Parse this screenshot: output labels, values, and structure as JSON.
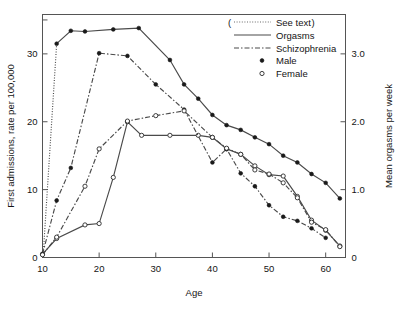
{
  "chart_data": {
    "type": "line",
    "title": "",
    "xlabel": "Age",
    "ylabel": "First admissions, rate per 100,000",
    "ylabel_right": "Mean orgasms per week",
    "xlim": [
      10,
      63.5
    ],
    "ylim": [
      0,
      35.8
    ],
    "ylim_right": [
      0,
      3.58
    ],
    "xticks": [
      10,
      20,
      30,
      40,
      50,
      60
    ],
    "xtick_labels": [
      "10",
      "20",
      "30",
      "40",
      "50",
      "60"
    ],
    "yticks": [
      0,
      10,
      20,
      30,
      35
    ],
    "ytick_labels": [
      "0",
      "10",
      "20",
      "30",
      ""
    ],
    "yticks_right": [
      0,
      1.0,
      2.0,
      3.0
    ],
    "ytick_labels_right": [
      "0",
      "1.0",
      "2.0",
      "3.0"
    ],
    "grid": false,
    "legend_position": "top-right",
    "legend": [
      {
        "label": "( See text)",
        "style": "dotted",
        "prefix": "(",
        "suffix": ")",
        "text": "See text"
      },
      {
        "label": "Orgasms",
        "style": "solid"
      },
      {
        "label": "Schizophrenia",
        "style": "dashdot"
      },
      {
        "label": "Male",
        "style": "marker-filled"
      },
      {
        "label": "Female",
        "style": "marker-open"
      }
    ],
    "series": [
      {
        "name": "See text",
        "style": "dotted",
        "marker": "none",
        "axis": "left",
        "x": [
          10,
          10.2,
          12.5
        ],
        "values": [
          0.4,
          1.4,
          31.5
        ]
      },
      {
        "name": "Orgasms Male",
        "style": "solid",
        "marker": "filled",
        "axis": "right",
        "x": [
          12.5,
          15,
          17.5,
          22.5,
          27,
          32.5,
          35,
          37.5,
          40,
          42.5,
          45,
          47.5,
          50,
          52.5,
          55,
          57.5,
          60,
          62.5
        ],
        "values": [
          3.15,
          3.34,
          3.33,
          3.36,
          3.38,
          2.91,
          2.55,
          2.34,
          2.1,
          1.95,
          1.88,
          1.77,
          1.67,
          1.5,
          1.4,
          1.23,
          1.1,
          0.87
        ]
      },
      {
        "name": "Orgasms Female",
        "style": "solid",
        "marker": "open",
        "axis": "right",
        "x": [
          10,
          12.5,
          17.5,
          20,
          22.5,
          25,
          27.5,
          32.5,
          37.5,
          40,
          42.5,
          45,
          47.5,
          50,
          52.5,
          55,
          57.5,
          60,
          62.5
        ],
        "values": [
          0.05,
          0.28,
          0.48,
          0.5,
          1.18,
          2.0,
          1.8,
          1.8,
          1.8,
          1.77,
          1.6,
          1.52,
          1.35,
          1.22,
          1.2,
          0.9,
          0.55,
          0.4,
          0.17
        ]
      },
      {
        "name": "Schizophrenia Male",
        "style": "dashdot",
        "marker": "filled",
        "axis": "left",
        "x": [
          10,
          12.5,
          15,
          20,
          25,
          30,
          35,
          40,
          42.5,
          45,
          47.5,
          50,
          52.5,
          55,
          57.5,
          60
        ],
        "values": [
          0.5,
          8.4,
          13.2,
          30.1,
          29.7,
          25.5,
          21.8,
          14.0,
          16.0,
          12.4,
          10.5,
          7.7,
          6.0,
          5.4,
          4.3,
          2.9
        ]
      },
      {
        "name": "Schizophrenia Female",
        "style": "dashdot",
        "marker": "open",
        "axis": "left",
        "x": [
          10,
          12.5,
          17.5,
          20,
          25,
          30,
          35,
          40,
          42.5,
          45,
          47.5,
          50,
          52.5,
          55,
          57.5,
          60,
          62.5
        ],
        "values": [
          0.4,
          3.0,
          10.5,
          16.0,
          20.1,
          20.9,
          21.6,
          17.7,
          16.1,
          15.2,
          12.9,
          12.3,
          11.0,
          8.8,
          5.2,
          4.1,
          1.6
        ]
      }
    ]
  },
  "axes": {
    "x_label": "Age",
    "y_left_label": "First admissions, rate per 100,000",
    "y_right_label": "Mean orgasms per week"
  },
  "legend": {
    "see_text": "See text",
    "paren_open": "(",
    "paren_close": ")",
    "orgasms": "Orgasms",
    "schizophrenia": "Schizophrenia",
    "male": "Male",
    "female": "Female"
  },
  "colors": {
    "line": "#4a4a4a",
    "frame": "#555555",
    "text": "#141414",
    "marker_fill": "#1a1a1a",
    "marker_open": "#ffffff",
    "background": "#ffffff"
  }
}
